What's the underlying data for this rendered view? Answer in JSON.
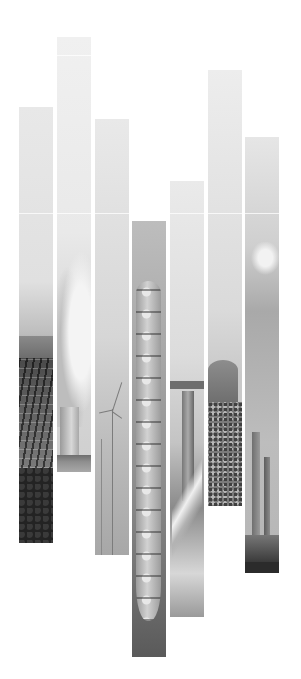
{
  "image": {
    "description": "Decorative vertical photo strips of energy and industry scenes on white background",
    "background_color": "#ffffff",
    "strips": [
      {
        "subject": "solar panels on hillside",
        "left": 19,
        "top": 107,
        "bottom": 543
      },
      {
        "subject": "cooling tower steam",
        "left": 57,
        "top": 37,
        "bottom": 472
      },
      {
        "subject": "offshore wind turbines",
        "left": 95,
        "top": 119,
        "bottom": 555
      },
      {
        "subject": "cargo ship from above",
        "left": 132,
        "top": 221,
        "bottom": 657
      },
      {
        "subject": "bridge and highway",
        "left": 170,
        "top": 181,
        "bottom": 617
      },
      {
        "subject": "barn and crop field",
        "left": 208,
        "top": 70,
        "bottom": 506
      },
      {
        "subject": "industrial chimneys with smoke",
        "left": 245,
        "top": 137,
        "bottom": 573
      }
    ],
    "strip_width": 34,
    "horizontal_line_y": 213
  }
}
